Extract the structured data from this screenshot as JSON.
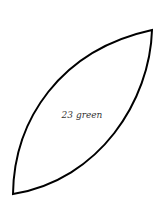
{
  "diagram": {
    "shape": "lens",
    "label": "23 green",
    "stroke_color": "#000000",
    "fill_color": "#ffffff",
    "text_color": "#333333"
  }
}
